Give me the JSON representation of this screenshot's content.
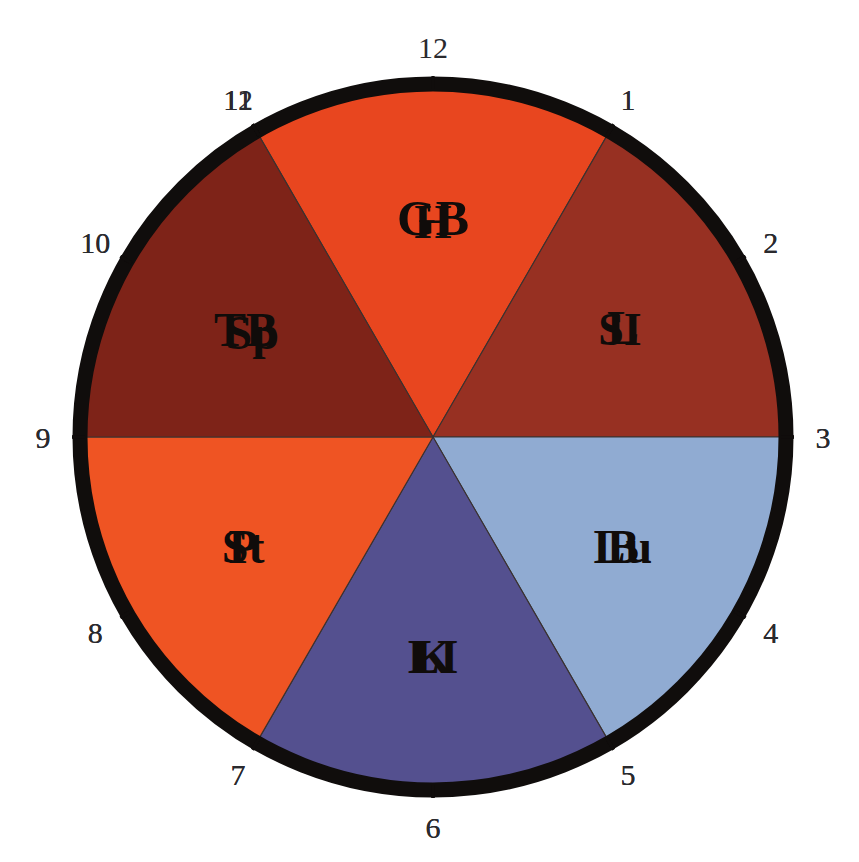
{
  "diagram": {
    "geometry": {
      "center_x": 433,
      "center_y": 437,
      "radius": 348,
      "rim_color": "#100d0c",
      "background": "#ffffff"
    }
  },
  "chart_data": {
    "type": "pie",
    "xlabel": "",
    "ylabel": "",
    "legend_position": "none",
    "grid": false,
    "categories": [
      "GB",
      "L",
      "Lu",
      "LI",
      "St",
      "Sp",
      "H",
      "SI",
      "B",
      "K",
      "P",
      "TB"
    ],
    "values": [
      2,
      2,
      2,
      2,
      2,
      2,
      2,
      2,
      2,
      2,
      2,
      2
    ],
    "units": "hours",
    "note": "Twelve equal two-hour segments around a 12-hour dial; hour numbers 1-12 appear twice (inner ring am/pm positions)"
  },
  "segments": [
    {
      "id": "gb",
      "label": "GB",
      "color": "#b0dd50",
      "start_hour": 11,
      "end_hour": 1,
      "start_deg": -30,
      "end_deg": 30,
      "label_deg": 0,
      "label_radius": 0.63,
      "font_size": 50
    },
    {
      "id": "l",
      "label": "L",
      "color": "#5fb762",
      "start_hour": 1,
      "end_hour": 3,
      "start_deg": 30,
      "end_deg": 90,
      "label_deg": 60,
      "label_radius": 0.63,
      "font_size": 48
    },
    {
      "id": "lu",
      "label": "Lu",
      "color": "#cbcbcb",
      "start_hour": 3,
      "end_hour": 5,
      "start_deg": 90,
      "end_deg": 150,
      "label_deg": 120,
      "label_radius": 0.63,
      "font_size": 48
    },
    {
      "id": "li",
      "label": "LI",
      "color": "#7f7f7f",
      "start_hour": 5,
      "end_hour": 7,
      "start_deg": 150,
      "end_deg": 210,
      "label_deg": 180,
      "label_radius": 0.63,
      "font_size": 48
    },
    {
      "id": "st",
      "label": "St",
      "color": "#f5ef2e",
      "start_hour": 7,
      "end_hour": 9,
      "start_deg": 210,
      "end_deg": 270,
      "label_deg": 240,
      "label_radius": 0.63,
      "font_size": 48
    },
    {
      "id": "sp",
      "label": "Sp",
      "color": "#eccd4f",
      "start_hour": 9,
      "end_hour": 11,
      "start_deg": 270,
      "end_deg": 330,
      "label_deg": 300,
      "label_radius": 0.6,
      "font_size": 48
    },
    {
      "id": "h",
      "label": "H",
      "color": "#e8461f",
      "start_hour": 11,
      "end_hour": 1,
      "start_deg": 330,
      "end_deg": 390,
      "label_deg": 360,
      "label_radius": 0.62,
      "font_size": 48
    },
    {
      "id": "si",
      "label": "SI",
      "color": "#973022",
      "start_hour": 1,
      "end_hour": 3,
      "start_deg": 390,
      "end_deg": 450,
      "label_deg": 420,
      "label_radius": 0.62,
      "font_size": 46
    },
    {
      "id": "b",
      "label": "B",
      "color": "#90abd2",
      "start_hour": 3,
      "end_hour": 5,
      "start_deg": 450,
      "end_deg": 510,
      "label_deg": 480,
      "label_radius": 0.63,
      "font_size": 48
    },
    {
      "id": "k",
      "label": "K",
      "color": "#54508f",
      "start_hour": 5,
      "end_hour": 7,
      "start_deg": 510,
      "end_deg": 570,
      "label_deg": 540,
      "label_radius": 0.63,
      "font_size": 48
    },
    {
      "id": "p",
      "label": "P",
      "color": "#ef5423",
      "start_hour": 7,
      "end_hour": 9,
      "start_deg": 570,
      "end_deg": 630,
      "label_deg": 600,
      "label_radius": 0.63,
      "font_size": 48
    },
    {
      "id": "tb",
      "label": "TB",
      "color": "#7e2318",
      "start_hour": 9,
      "end_hour": 11,
      "start_deg": 630,
      "end_deg": 690,
      "label_deg": 660,
      "label_radius": 0.62,
      "font_size": 48
    }
  ],
  "hour_marks": [
    {
      "label": "12",
      "deg": -30,
      "side": "top"
    },
    {
      "label": "1",
      "deg": 30,
      "side": "top-right"
    },
    {
      "label": "2",
      "deg": 60,
      "side": "right"
    },
    {
      "label": "3",
      "deg": 90,
      "side": "right"
    },
    {
      "label": "4",
      "deg": 120,
      "side": "right"
    },
    {
      "label": "5",
      "deg": 150,
      "side": "right"
    },
    {
      "label": "6",
      "deg": 180,
      "side": "right"
    },
    {
      "label": "7",
      "deg": 210,
      "side": "right"
    },
    {
      "label": "8",
      "deg": 240,
      "side": "bottom-right"
    },
    {
      "label": "9",
      "deg": 270,
      "side": "bottom-right"
    },
    {
      "label": "10",
      "deg": 300,
      "side": "bottom"
    },
    {
      "label": "11",
      "deg": 330,
      "side": "bottom"
    },
    {
      "label": "12",
      "deg": 360,
      "side": "bottom"
    },
    {
      "label": "1",
      "deg": 390,
      "side": "bottom"
    },
    {
      "label": "2",
      "deg": 420,
      "side": "bottom-left"
    },
    {
      "label": "3",
      "deg": 450,
      "side": "bottom-left"
    },
    {
      "label": "4",
      "deg": 480,
      "side": "left"
    },
    {
      "label": "5",
      "deg": 510,
      "side": "left"
    },
    {
      "label": "6",
      "deg": 540,
      "side": "left"
    },
    {
      "label": "7",
      "deg": 570,
      "side": "left"
    },
    {
      "label": "8",
      "deg": 600,
      "side": "left"
    },
    {
      "label": "9",
      "deg": 630,
      "side": "top-left"
    },
    {
      "label": "10",
      "deg": 660,
      "side": "top-left"
    },
    {
      "label": "11",
      "deg": 690,
      "side": "top"
    }
  ]
}
